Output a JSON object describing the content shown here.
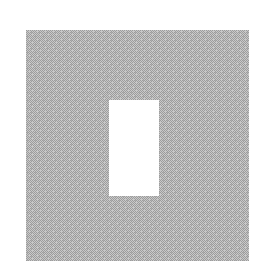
{
  "image": {
    "kind": "graphic",
    "description": "A dithered light-gray square with a white rectangular cutout near the center",
    "background_color": "#ffffff",
    "canvas_width": 269,
    "canvas_height": 279,
    "text_content": ""
  },
  "shapes": {
    "gray_square": {
      "name": "gray-square",
      "shape": "rectangle",
      "x": 26,
      "y": 30,
      "width": 223,
      "height": 231,
      "fill_color": "#b5b5b5",
      "dither_light_color": "#ffffff",
      "dither_dark_color": "#9b9b9b",
      "texture": "fine checkerboard halftone dither",
      "label": ""
    },
    "white_cutout": {
      "name": "white-cutout",
      "shape": "rectangle",
      "x": 109,
      "y": 100,
      "width": 50,
      "height": 96,
      "fill_color": "#ffffff",
      "label": ""
    }
  }
}
